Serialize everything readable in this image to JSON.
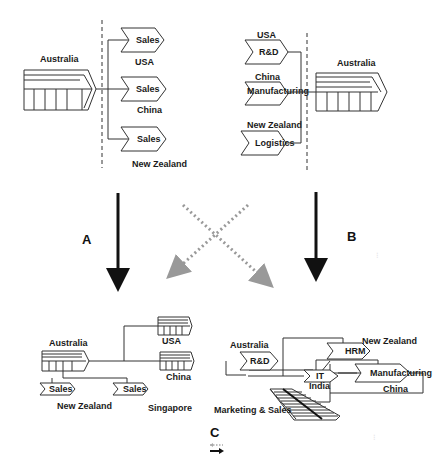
{
  "panels": {
    "top_left": {
      "hub": "Australia",
      "chevrons": [
        {
          "label": "Sales",
          "country": "USA"
        },
        {
          "label": "Sales",
          "country": "China"
        },
        {
          "label": "Sales",
          "country": "New Zealand"
        }
      ]
    },
    "top_right": {
      "hub": "Australia",
      "chevrons": [
        {
          "label": "R&D",
          "country": "USA"
        },
        {
          "label": "Manufacturing",
          "country": "China"
        },
        {
          "label": "Logistics",
          "country": "New Zealand"
        }
      ]
    },
    "bottom_left": {
      "hub": "Australia",
      "factories": [
        {
          "country": "USA"
        },
        {
          "country": "China"
        }
      ],
      "chevrons": [
        {
          "label": "Sales",
          "country": "New Zealand"
        },
        {
          "label": "Sales",
          "country": "Singapore"
        }
      ]
    },
    "bottom_right": {
      "nodes": [
        {
          "label": "R&D",
          "country": "Australia"
        },
        {
          "label": "HRM",
          "country": "New Zealand"
        },
        {
          "label": "IT",
          "country": "India"
        },
        {
          "label": "Manufacturing",
          "country": "China"
        }
      ],
      "stack_label": "Marketing & Sales"
    }
  },
  "transitions": {
    "a": "A",
    "b": "B",
    "c": "C"
  },
  "colors": {
    "line": "#333333",
    "arrow": "#111111",
    "dotted_arrow": "#999999"
  }
}
